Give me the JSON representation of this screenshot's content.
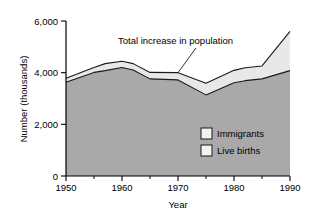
{
  "chart_data": {
    "type": "area",
    "title": "",
    "subtitle": "",
    "xlabel": "Year",
    "ylabel": "Number (thousands)",
    "xlim": [
      1950,
      1990
    ],
    "ylim": [
      0,
      6000
    ],
    "grid": false,
    "stacked": true,
    "legend_position": "inside-bottom-right",
    "x_ticks": [
      1950,
      1960,
      1970,
      1980,
      1990
    ],
    "x_tick_labels": [
      "1950",
      "1960",
      "1970",
      "1980",
      "1990"
    ],
    "x_minor_ticks": [
      1955,
      1965,
      1975,
      1985
    ],
    "y_ticks": [
      0,
      2000,
      4000,
      6000
    ],
    "y_tick_labels": [
      "0",
      "2,000",
      "4,000",
      "6,000"
    ],
    "x": [
      1950,
      1955,
      1957,
      1960,
      1962,
      1965,
      1970,
      1975,
      1980,
      1982,
      1985,
      1990
    ],
    "series": [
      {
        "name": "Live births",
        "color": "#a9a9a9",
        "values": [
          3630,
          4010,
          4080,
          4200,
          4100,
          3760,
          3720,
          3140,
          3610,
          3690,
          3760,
          4080
        ]
      },
      {
        "name": "Immigrants",
        "color": "#e8e8e8",
        "values": [
          150,
          190,
          270,
          240,
          250,
          250,
          280,
          450,
          480,
          500,
          500,
          1520
        ]
      }
    ],
    "total": {
      "name": "Total increase in population",
      "values": [
        3780,
        4200,
        4350,
        4440,
        4350,
        4010,
        4000,
        3590,
        4090,
        4190,
        4260,
        5600
      ]
    },
    "annotations": [
      {
        "text": "Total increase in population",
        "points_to_x": 1970,
        "points_to_y": 4000
      }
    ]
  },
  "legend": {
    "items": [
      {
        "label": "Immigrants",
        "swatch": "#f2f2f2"
      },
      {
        "label": "Live births",
        "swatch": "#f2f2f2"
      }
    ]
  },
  "axes": {
    "y_title": "Number (thousands)",
    "x_title": "Year",
    "y_labels": [
      "6,000",
      "4,000",
      "2,000",
      "0"
    ],
    "x_labels": [
      "1950",
      "1960",
      "1970",
      "1980",
      "1990"
    ]
  },
  "annotation": {
    "text": "Total increase in population"
  },
  "colors": {
    "live_births_fill": "#a9a9a9",
    "immigrants_fill": "#e8e8e8",
    "axis": "#000000",
    "line": "#1a1a1a"
  }
}
